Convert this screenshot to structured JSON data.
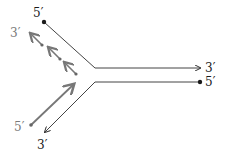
{
  "diagram": {
    "type": "dna-replication-fork",
    "colors": {
      "parental_strand": "#333333",
      "new_strand": "#777777",
      "background": "#ffffff"
    },
    "labels": {
      "top_parental_5prime": "5′",
      "top_parental_3prime": "3′",
      "bottom_parental_5prime": "5′",
      "bottom_parental_3prime": "3′",
      "lagging_3prime": "3′",
      "leading_5prime": "5′"
    },
    "lagging_fragment_count": 3
  }
}
